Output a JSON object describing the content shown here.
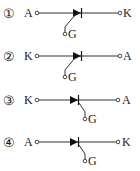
{
  "options": [
    {
      "number": "①",
      "left_terminal": "A",
      "right_terminal": "K",
      "gate_label": "G",
      "gate_side": "anode-side",
      "diode_direction": "right"
    },
    {
      "number": "②",
      "left_terminal": "K",
      "right_terminal": "A",
      "gate_label": "G",
      "gate_side": "anode-side",
      "diode_direction": "right"
    },
    {
      "number": "③",
      "left_terminal": "K",
      "right_terminal": "A",
      "gate_label": "G",
      "gate_side": "cathode-side",
      "diode_direction": "right"
    },
    {
      "number": "④",
      "left_terminal": "A",
      "right_terminal": "K",
      "gate_label": "G",
      "gate_side": "cathode-side",
      "diode_direction": "right"
    }
  ],
  "colors": {
    "line": "#333333",
    "symbol": "#111111",
    "background": "#ffffff"
  }
}
